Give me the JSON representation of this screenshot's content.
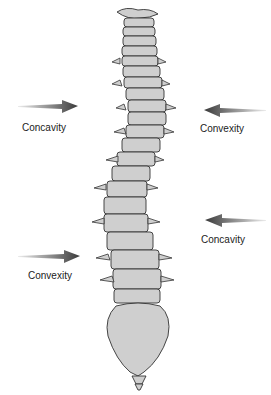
{
  "diagram": {
    "colors": {
      "bone_fill": "#cfcfcf",
      "bone_stroke": "#333333",
      "arrow": "#3a3a3a",
      "text": "#222222"
    },
    "annotations": [
      {
        "id": "upper-left",
        "label": "Concavity",
        "arrow_direction": "right",
        "x": 22,
        "y": 122
      },
      {
        "id": "upper-right",
        "label": "Convexity",
        "arrow_direction": "left",
        "x": 200,
        "y": 123
      },
      {
        "id": "lower-right",
        "label": "Concavity",
        "arrow_direction": "left",
        "x": 201,
        "y": 234
      },
      {
        "id": "lower-left",
        "label": "Convexity",
        "arrow_direction": "right",
        "x": 28,
        "y": 270
      }
    ]
  }
}
